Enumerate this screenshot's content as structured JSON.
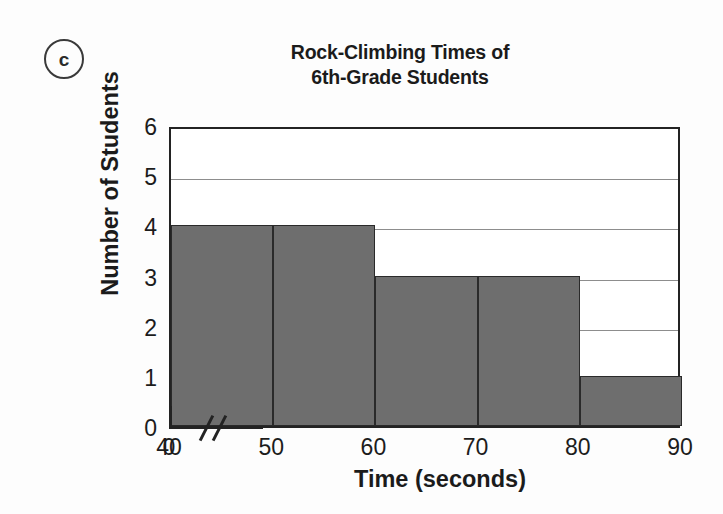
{
  "part_label": "c",
  "chart_data": {
    "type": "bar",
    "title": "Rock-Climbing Times of 6th-Grade Students",
    "title_lines": [
      "Rock-Climbing Times of",
      "6th-Grade Students"
    ],
    "xlabel": "Time (seconds)",
    "ylabel": "Number of Students",
    "grid": true,
    "legend": "none",
    "bar_color": "#6e6e6e",
    "bar_edge_color": "#2a2a2a",
    "axis_color": "#232323",
    "gridline_color": "#8d8d8d",
    "background": "#fdfdfd",
    "plot_background": "#ffffff",
    "axis_break": true,
    "axis_break_note": "x-axis broken between 0 and 40",
    "xlim": [
      40,
      90
    ],
    "ylim": [
      0,
      6
    ],
    "xticks": [
      "0",
      "40",
      "50",
      "60",
      "70",
      "80",
      "90"
    ],
    "yticks": [
      "0",
      "1",
      "2",
      "3",
      "4",
      "5",
      "6"
    ],
    "bin_edges": [
      40,
      50,
      60,
      70,
      80,
      90
    ],
    "categories": [
      "40-50",
      "50-60",
      "60-70",
      "70-80",
      "80-90"
    ],
    "values": [
      4,
      4,
      3,
      3,
      1
    ],
    "bars": [
      {
        "label": "40-50",
        "start": 40,
        "end": 50,
        "value": 4
      },
      {
        "label": "50-60",
        "start": 50,
        "end": 60,
        "value": 4
      },
      {
        "label": "60-70",
        "start": 60,
        "end": 70,
        "value": 3
      },
      {
        "label": "70-80",
        "start": 70,
        "end": 80,
        "value": 3
      },
      {
        "label": "80-90",
        "start": 80,
        "end": 90,
        "value": 1
      }
    ]
  }
}
